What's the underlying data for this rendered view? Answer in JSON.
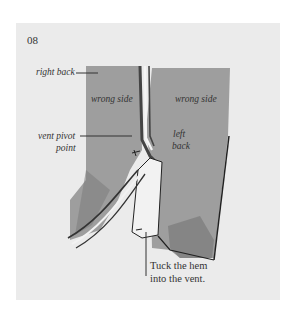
{
  "figure": {
    "step_number": "08",
    "labels": {
      "right_back": "right back",
      "wrong_side_left": "wrong side",
      "wrong_side_right": "wrong side",
      "vent_pivot_line1": "vent pivot",
      "vent_pivot_line2": "point",
      "left_back_line1": "left",
      "left_back_line2": "back"
    },
    "caption_line1": "Tuck the hem",
    "caption_line2": "into the vent."
  }
}
